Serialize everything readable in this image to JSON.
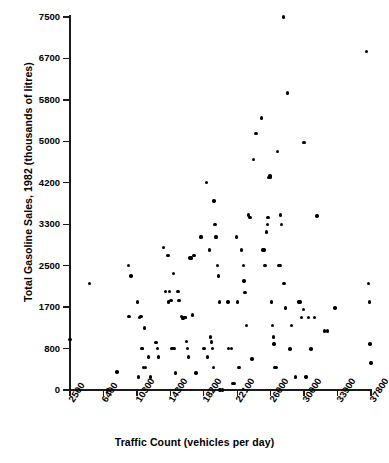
{
  "chart_data": {
    "type": "scatter",
    "title": "",
    "xlabel": "Traffic Count (vehicles per day)",
    "ylabel": "Total Gasoline Sales, 1982 (thousands of litres)",
    "xticks": [
      2500,
      6400,
      10300,
      14300,
      18200,
      22100,
      26000,
      30000,
      33900,
      37800
    ],
    "xtick_labels": [
      "2500",
      "6400",
      "10300",
      "14300",
      "18200",
      "22100",
      "26000",
      "30000",
      "33900",
      "37800"
    ],
    "yticks": [
      0,
      800,
      1700,
      2500,
      3300,
      4200,
      5000,
      5800,
      6700,
      7500
    ],
    "ytick_labels": [
      "0",
      "800",
      "1700",
      "2500",
      "3300",
      "4200",
      "5000",
      "5800",
      "6700",
      "7500"
    ],
    "xlim": [
      2500,
      37800
    ],
    "ylim": [
      0,
      7500
    ],
    "grid": false,
    "legend": null,
    "marker": "filled-circle",
    "marker_color": "#000000",
    "points": [
      [
        2500,
        1000
      ],
      [
        4800,
        2150
      ],
      [
        6900,
        0
      ],
      [
        8000,
        350
      ],
      [
        9300,
        2500
      ],
      [
        9400,
        1500
      ],
      [
        9600,
        2300
      ],
      [
        10400,
        1800
      ],
      [
        10500,
        250
      ],
      [
        10600,
        1480
      ],
      [
        10800,
        1500
      ],
      [
        10900,
        800
      ],
      [
        11000,
        800
      ],
      [
        11100,
        430
      ],
      [
        11200,
        1250
      ],
      [
        11300,
        430
      ],
      [
        11700,
        640
      ],
      [
        11900,
        250
      ],
      [
        12600,
        930
      ],
      [
        12800,
        800
      ],
      [
        12900,
        640
      ],
      [
        13500,
        2850
      ],
      [
        13700,
        2000
      ],
      [
        14000,
        2700
      ],
      [
        14100,
        1800
      ],
      [
        14200,
        2000
      ],
      [
        14300,
        1830
      ],
      [
        14400,
        1830
      ],
      [
        14500,
        800
      ],
      [
        14600,
        800
      ],
      [
        14700,
        2350
      ],
      [
        14800,
        800
      ],
      [
        14900,
        330
      ],
      [
        15200,
        2000
      ],
      [
        15300,
        1830
      ],
      [
        15600,
        1500
      ],
      [
        15700,
        1450
      ],
      [
        15800,
        1450
      ],
      [
        15900,
        1480
      ],
      [
        16000,
        1480
      ],
      [
        16100,
        1480
      ],
      [
        16200,
        950
      ],
      [
        16300,
        800
      ],
      [
        16400,
        640
      ],
      [
        16600,
        2650
      ],
      [
        16800,
        2650
      ],
      [
        16900,
        1530
      ],
      [
        17000,
        2700
      ],
      [
        17100,
        2700
      ],
      [
        17300,
        330
      ],
      [
        17800,
        3050
      ],
      [
        17900,
        3050
      ],
      [
        18200,
        800
      ],
      [
        18300,
        800
      ],
      [
        18500,
        4200
      ],
      [
        18600,
        640
      ],
      [
        18900,
        2800
      ],
      [
        19000,
        1050
      ],
      [
        19100,
        940
      ],
      [
        19200,
        800
      ],
      [
        19300,
        430
      ],
      [
        19400,
        3800
      ],
      [
        19500,
        3300
      ],
      [
        19600,
        3050
      ],
      [
        19700,
        3050
      ],
      [
        19800,
        2500
      ],
      [
        19900,
        2300
      ],
      [
        20000,
        1800
      ],
      [
        20100,
        0
      ],
      [
        20400,
        0
      ],
      [
        21000,
        1800
      ],
      [
        21100,
        800
      ],
      [
        21400,
        800
      ],
      [
        21600,
        130
      ],
      [
        21800,
        130
      ],
      [
        22000,
        3050
      ],
      [
        22100,
        1800
      ],
      [
        22300,
        430
      ],
      [
        22600,
        2800
      ],
      [
        22800,
        2500
      ],
      [
        22900,
        2200
      ],
      [
        23000,
        1980
      ],
      [
        23200,
        1300
      ],
      [
        23400,
        3500
      ],
      [
        23600,
        3450
      ],
      [
        23800,
        600
      ],
      [
        24000,
        4650
      ],
      [
        24300,
        5150
      ],
      [
        24900,
        5450
      ],
      [
        25100,
        2800
      ],
      [
        25200,
        2800
      ],
      [
        25300,
        2500
      ],
      [
        25400,
        2500
      ],
      [
        25500,
        3150
      ],
      [
        25600,
        3300
      ],
      [
        25700,
        3450
      ],
      [
        25800,
        4300
      ],
      [
        25900,
        4330
      ],
      [
        26000,
        4300
      ],
      [
        26100,
        1800
      ],
      [
        26200,
        1300
      ],
      [
        26300,
        1050
      ],
      [
        26400,
        900
      ],
      [
        26500,
        430
      ],
      [
        26700,
        430
      ],
      [
        26800,
        4800
      ],
      [
        27000,
        2500
      ],
      [
        27100,
        2500
      ],
      [
        27200,
        3500
      ],
      [
        27300,
        3300
      ],
      [
        27500,
        7500
      ],
      [
        27600,
        2150
      ],
      [
        27800,
        1680
      ],
      [
        28000,
        5950
      ],
      [
        28300,
        790
      ],
      [
        28500,
        1300
      ],
      [
        29000,
        250
      ],
      [
        29400,
        1800
      ],
      [
        29500,
        1800
      ],
      [
        29700,
        1480
      ],
      [
        29900,
        1650
      ],
      [
        30000,
        4980
      ],
      [
        30200,
        250
      ],
      [
        30500,
        1480
      ],
      [
        30800,
        790
      ],
      [
        31200,
        1480
      ],
      [
        31500,
        3480
      ],
      [
        32400,
        1180
      ],
      [
        32700,
        1180
      ],
      [
        33600,
        1680
      ],
      [
        37300,
        6830
      ],
      [
        37500,
        2150
      ],
      [
        37600,
        1800
      ],
      [
        37700,
        900
      ],
      [
        37800,
        520
      ]
    ]
  }
}
